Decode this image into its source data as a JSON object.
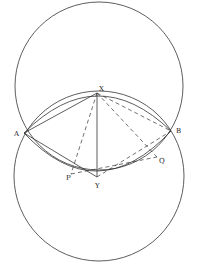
{
  "diagram": {
    "type": "geometry",
    "points": {
      "A": {
        "label": "A",
        "x": 24,
        "y": 133
      },
      "B": {
        "label": "B",
        "x": 171,
        "y": 131
      },
      "X": {
        "label": "X",
        "x": 97,
        "y": 93
      },
      "Y": {
        "label": "Y",
        "x": 97,
        "y": 177
      },
      "P": {
        "label": "P",
        "x": 71,
        "y": 174
      },
      "Q": {
        "label": "Q",
        "x": 157,
        "y": 157
      }
    },
    "circles": [
      {
        "name": "upper-circle",
        "cx": 99,
        "cy": 86,
        "r": 84
      },
      {
        "name": "lower-circle",
        "cx": 99,
        "cy": 176,
        "r": 85
      }
    ],
    "arcs": [
      {
        "name": "arc-AXB",
        "through": "X"
      },
      {
        "name": "arc-AYB",
        "through": "Y"
      }
    ],
    "solid_segments": [
      [
        "A",
        "X"
      ],
      [
        "A",
        "Y"
      ],
      [
        "X",
        "Y"
      ]
    ],
    "dashed_segments": [
      [
        "X",
        "P"
      ],
      [
        "X",
        "Q"
      ],
      [
        "X",
        "B"
      ],
      [
        "P",
        "Q"
      ],
      [
        "Y",
        "B"
      ]
    ],
    "stroke_color": "#333333"
  }
}
